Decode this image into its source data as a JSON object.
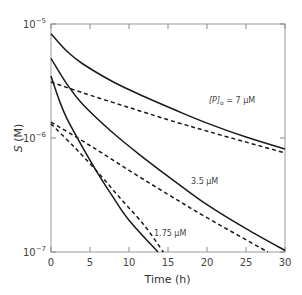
{
  "chart_data": {
    "type": "line",
    "title": "",
    "xlabel": "Time (h)",
    "ylabel": "S (M)",
    "xlim": [
      0,
      30
    ],
    "ylim": [
      1e-07,
      1e-05
    ],
    "yscale": "log",
    "grid": false,
    "x_ticks": [
      "0",
      "5",
      "10",
      "15",
      "20",
      "25",
      "30"
    ],
    "y_ticks": [
      {
        "base": "10",
        "exp": "−5",
        "value": 1e-05
      },
      {
        "base": "10",
        "exp": "−6",
        "value": 1e-06
      },
      {
        "base": "10",
        "exp": "−7",
        "value": 1e-07
      }
    ],
    "annotations": [
      {
        "text_main": "[P]",
        "text_sub": "o",
        "text_rest": " = 7 μM",
        "series": "7 μM"
      },
      {
        "text": "3.5 μM",
        "series": "3.5 μM"
      },
      {
        "text": "1.75 μM",
        "series": "1.75 μM"
      }
    ],
    "series": [
      {
        "name": "7 μM",
        "style": "solid",
        "x": [
          0,
          2,
          4,
          8,
          12,
          16,
          20,
          25,
          30
        ],
        "values": [
          8.2e-06,
          5.8e-06,
          4.5e-06,
          3.1e-06,
          2.3e-06,
          1.75e-06,
          1.35e-06,
          1.02e-06,
          8e-07
        ]
      },
      {
        "name": "7 μM",
        "style": "dashed",
        "x": [
          0,
          4,
          10,
          16,
          22,
          30
        ],
        "values": [
          3.1e-06,
          2.5e-06,
          1.85e-06,
          1.38e-06,
          1.05e-06,
          7.4e-07
        ]
      },
      {
        "name": "3.5 μM",
        "style": "solid",
        "x": [
          0,
          2,
          4,
          8,
          12,
          16,
          20,
          25,
          30
        ],
        "values": [
          5e-06,
          3e-06,
          2e-06,
          1.1e-06,
          6.6e-07,
          4.1e-07,
          2.6e-07,
          1.6e-07,
          1.03e-07
        ]
      },
      {
        "name": "3.5 μM",
        "style": "dashed",
        "x": [
          0,
          5,
          10,
          15,
          20,
          27.8
        ],
        "values": [
          1.38e-06,
          8.6e-07,
          5.2e-07,
          3.2e-07,
          2e-07,
          1e-07
        ]
      },
      {
        "name": "1.75 μM",
        "style": "solid",
        "x": [
          0,
          1,
          2,
          4,
          6,
          8,
          10,
          13.7
        ],
        "values": [
          3.5e-06,
          2.2e-06,
          1.5e-06,
          8.4e-07,
          4.9e-07,
          3e-07,
          1.9e-07,
          1e-07
        ]
      },
      {
        "name": "1.75 μM",
        "style": "dashed",
        "x": [
          0,
          3,
          6,
          9,
          12,
          14.4
        ],
        "values": [
          1.33e-06,
          8.3e-07,
          5e-07,
          2.9e-07,
          1.7e-07,
          1e-07
        ]
      }
    ]
  }
}
